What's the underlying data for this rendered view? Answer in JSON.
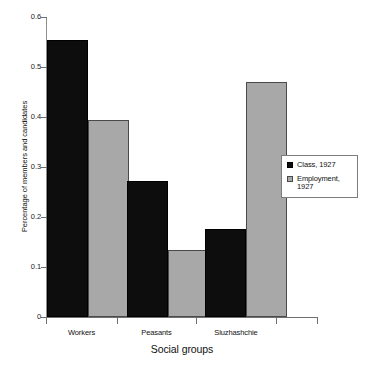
{
  "chart_data": {
    "type": "bar",
    "title": "",
    "subtitle": "",
    "xlabel": "Social groups",
    "ylabel": "Percentage of members and candidates",
    "categories": [
      "Workers",
      "Peasants",
      "Sluzhashchie"
    ],
    "series": [
      {
        "name": "Class, 1927",
        "color": "#0d0d0d",
        "values": [
          0.554,
          0.272,
          0.176
        ]
      },
      {
        "name": "Employment, 1927",
        "color": "#a8a8a8",
        "values": [
          0.394,
          0.134,
          0.47
        ]
      }
    ],
    "ylim": [
      0,
      0.6
    ],
    "yticks": [
      "0",
      "0.1",
      "0.2",
      "0.3",
      "0.4",
      "0.5",
      "0.6"
    ],
    "ytick_values": [
      0,
      0.1,
      0.2,
      0.3,
      0.4,
      0.5,
      0.6
    ],
    "grid": false,
    "legend_position": "right-middle",
    "legend_entries": [
      "Class, 1927",
      "Employment,\n1927"
    ]
  }
}
